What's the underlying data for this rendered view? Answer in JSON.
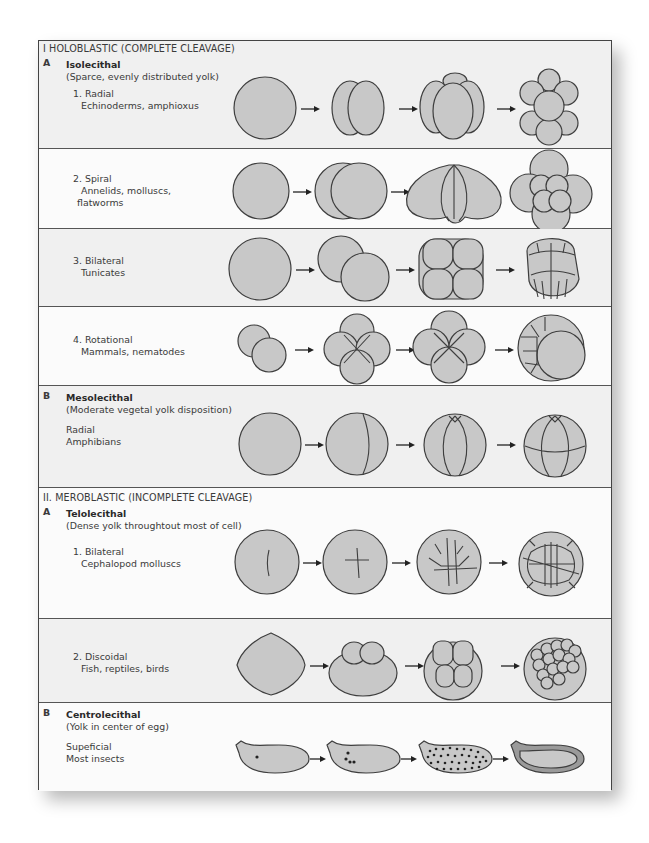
{
  "sections": {
    "holoblastic": {
      "header": "I HOLOBLASTIC (COMPLETE CLEAVAGE)",
      "A": {
        "letter": "A",
        "title": "Isolecithal",
        "subtitle": "(Sparce, evenly distributed yolk)",
        "types": [
          {
            "label": "1. Radial",
            "examples": "Echinoderms, amphioxus"
          },
          {
            "label": "2. Spiral",
            "examples": "Annelids, molluscs,",
            "examples2": "flatworms"
          },
          {
            "label": "3. Bilateral",
            "examples": "Tunicates"
          },
          {
            "label": "4. Rotational",
            "examples": "Mammals, nematodes"
          }
        ]
      },
      "B": {
        "letter": "B",
        "title": "Mesolecithal",
        "subtitle": "(Moderate vegetal yolk disposition)",
        "type": {
          "label": "Radial",
          "examples": "Amphibians"
        }
      }
    },
    "meroblastic": {
      "header": "II. MEROBLASTIC (INCOMPLETE CLEAVAGE)",
      "A": {
        "letter": "A",
        "title": "Telolecithal",
        "subtitle": "(Dense yolk throughtout most of cell)",
        "types": [
          {
            "label": "1. Bilateral",
            "examples": "Cephalopod molluscs"
          },
          {
            "label": "2. Discoidal",
            "examples": "Fish, reptiles, birds"
          }
        ]
      },
      "B": {
        "letter": "B",
        "title": "Centrolecithal",
        "subtitle": "(Yolk in center of egg)",
        "type": {
          "label": "Supeficial",
          "examples": "Most insects"
        }
      }
    }
  },
  "colors": {
    "cell_fill": "#c8c8c8",
    "outline": "#3e3e3e",
    "shaded_row": "#f0f0f0",
    "white_row": "#fbfbfb"
  }
}
